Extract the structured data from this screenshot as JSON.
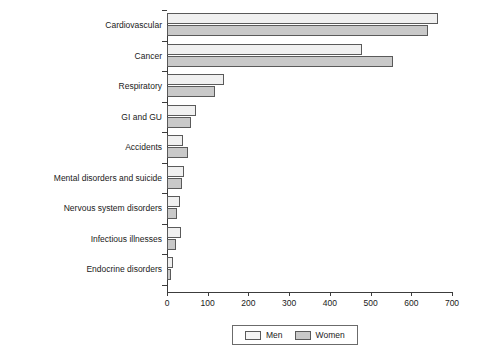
{
  "chart_data": {
    "type": "bar",
    "orientation": "horizontal",
    "title": "",
    "xlabel": "",
    "ylabel": "",
    "xlim": [
      0,
      700
    ],
    "xticks": [
      0,
      100,
      200,
      300,
      400,
      500,
      600,
      700
    ],
    "grid": false,
    "legend_position": "bottom",
    "categories": [
      "Cardiovascular",
      "Cancer",
      "Respiratory",
      "GI and GU",
      "Accidents",
      "Mental disorders and suicide",
      "Nervous system disorders",
      "Infectious illnesses",
      "Endocrine disorders"
    ],
    "series": [
      {
        "name": "Men",
        "color": "#f0f0f0",
        "values": [
          665,
          480,
          140,
          70,
          40,
          42,
          32,
          35,
          15
        ]
      },
      {
        "name": "Women",
        "color": "#c9c9c9",
        "values": [
          640,
          555,
          118,
          59,
          52,
          37,
          25,
          22,
          10
        ]
      }
    ]
  },
  "legend": {
    "entries": [
      {
        "label": "Men",
        "swatch": "men-swatch"
      },
      {
        "label": "Women",
        "swatch": "women-swatch"
      }
    ]
  }
}
